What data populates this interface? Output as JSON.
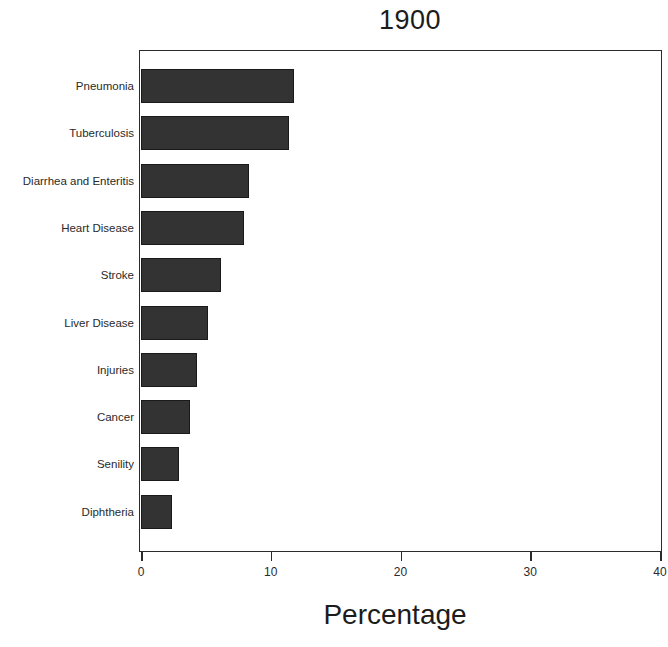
{
  "chart_data": {
    "type": "bar",
    "orientation": "horizontal",
    "title": "1900",
    "xlabel": "Percentage",
    "ylabel": "",
    "categories": [
      "Pneumonia",
      "Tuberculosis",
      "Diarrhea and Enteritis",
      "Heart Disease",
      "Stroke",
      "Liver Disease",
      "Injuries",
      "Cancer",
      "Senility",
      "Diphtheria"
    ],
    "values": [
      11.8,
      11.4,
      8.3,
      7.9,
      6.2,
      5.2,
      4.3,
      3.8,
      2.9,
      2.4
    ],
    "xlim": [
      0,
      40
    ],
    "xticks": [
      0,
      10,
      20,
      30,
      40
    ],
    "xtick_labels": [
      "0",
      "10",
      "20",
      "30",
      "40"
    ],
    "grid": false,
    "legend": false,
    "bar_color": "#333333",
    "bar_edge_color": "#1a1a1a",
    "axis_color": "#2b2b2b",
    "background_color": "#ffffff"
  }
}
